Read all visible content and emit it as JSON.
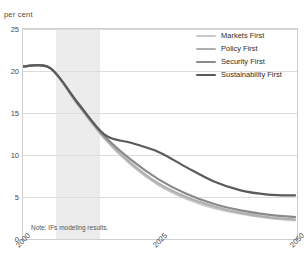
{
  "title": {
    "text": "Figure: population living in extreme poverty by scenario",
    "visible_fragment": ""
  },
  "unit_label": "per cent",
  "note": "Note: IFs modeling results.",
  "legend": {
    "position": "top-right",
    "entries": [
      {
        "label": "Markets First",
        "color": "#c9c9c9"
      },
      {
        "label": "Policy First",
        "color": "#b0b0b0"
      },
      {
        "label": "Security First",
        "color": "#8a8a8a"
      },
      {
        "label": "Sustainability First",
        "color": "#5a5a5a"
      }
    ]
  },
  "chart_data": {
    "type": "line",
    "title": "",
    "xlabel": "",
    "ylabel": "per cent",
    "xlim": [
      2000,
      2050
    ],
    "ylim": [
      0,
      25
    ],
    "yticks": [
      0,
      5,
      10,
      15,
      20,
      25
    ],
    "xticks": [
      2000,
      2025,
      2050
    ],
    "grid": true,
    "shaded_band": {
      "from": 2006,
      "to": 2014,
      "color": "#e9e9e9"
    },
    "x": [
      2000,
      2005,
      2010,
      2015,
      2020,
      2025,
      2030,
      2035,
      2040,
      2045,
      2050
    ],
    "series": [
      {
        "name": "Markets First",
        "color": "#c9c9c9",
        "values": [
          20.5,
          20.3,
          16.0,
          11.8,
          8.6,
          6.2,
          4.6,
          3.5,
          2.8,
          2.3,
          2.0
        ]
      },
      {
        "name": "Policy First",
        "color": "#b0b0b0",
        "values": [
          20.5,
          20.3,
          16.0,
          11.9,
          8.8,
          6.4,
          4.8,
          3.7,
          2.9,
          2.4,
          2.1
        ]
      },
      {
        "name": "Security First",
        "color": "#8a8a8a",
        "values": [
          20.5,
          20.3,
          16.1,
          12.1,
          9.2,
          6.9,
          5.2,
          4.0,
          3.2,
          2.7,
          2.4
        ]
      },
      {
        "name": "Sustainability First",
        "color": "#5a5a5a",
        "values": [
          20.5,
          20.3,
          16.2,
          12.3,
          11.3,
          10.2,
          8.4,
          6.7,
          5.6,
          5.1,
          5.0
        ]
      }
    ]
  }
}
